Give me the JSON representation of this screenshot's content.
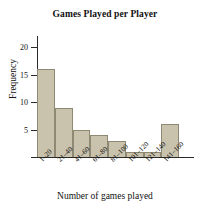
{
  "chart_data": {
    "type": "bar",
    "title": "Games Played per Player",
    "xlabel": "Number of games played",
    "ylabel": "Frequency",
    "categories": [
      "1–20",
      "21–40",
      "41–60",
      "61–80",
      "81–100",
      "101–120",
      "121–140",
      "141–160"
    ],
    "values": [
      16,
      9,
      5,
      4,
      3,
      1,
      1,
      6
    ],
    "ylim": [
      0,
      22
    ],
    "yticks": [
      5,
      10,
      15,
      20
    ],
    "ytick_labels": [
      "5",
      "10",
      "15",
      "20"
    ],
    "grid": false,
    "legend": "none",
    "bar_color": "#c9c2ac",
    "bar_edge_color": "#8f8872",
    "axis_color": "#2b2b2b",
    "background": "#ffffff"
  }
}
